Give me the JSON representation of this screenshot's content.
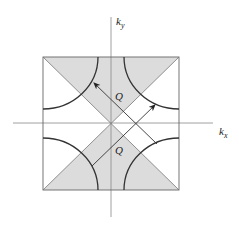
{
  "diagram": {
    "type": "brillouin-zone-fermi-surface",
    "axes": {
      "x_label": "k",
      "x_sub": "x",
      "y_label": "k",
      "y_sub": "y"
    },
    "nesting_vector_labels": [
      "Q",
      "Q"
    ],
    "colors": {
      "shade": "#dcdcdc",
      "line": "#333333",
      "axis": "#777777"
    }
  }
}
